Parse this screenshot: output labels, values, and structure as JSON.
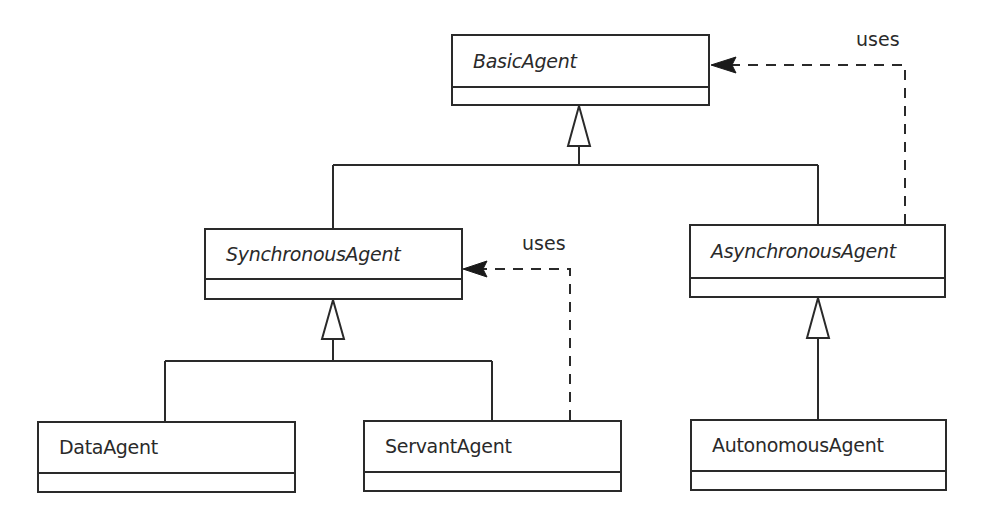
{
  "diagram": {
    "type": "uml-class-diagram",
    "colors": {
      "background": "#ffffff",
      "line": "#2a2a2a"
    },
    "classes": [
      {
        "id": "basic",
        "name": "BasicAgent",
        "abstract": true,
        "x": 451,
        "y": 34,
        "w": 259,
        "h": 72,
        "divider": 52
      },
      {
        "id": "sync",
        "name": "SynchronousAgent",
        "abstract": true,
        "x": 204,
        "y": 228,
        "w": 259,
        "h": 72,
        "divider": 50
      },
      {
        "id": "async",
        "name": "AsynchronousAgent",
        "abstract": true,
        "x": 689,
        "y": 224,
        "w": 257,
        "h": 74,
        "divider": 53
      },
      {
        "id": "data",
        "name": "DataAgent",
        "abstract": false,
        "x": 37,
        "y": 421,
        "w": 259,
        "h": 72,
        "divider": 51
      },
      {
        "id": "servant",
        "name": "ServantAgent",
        "abstract": false,
        "x": 363,
        "y": 420,
        "w": 259,
        "h": 72,
        "divider": 51
      },
      {
        "id": "autonomous",
        "name": "AutonomousAgent",
        "abstract": false,
        "x": 690,
        "y": 419,
        "w": 257,
        "h": 72,
        "divider": 51
      }
    ],
    "generalizations": [
      {
        "parent": "BasicAgent",
        "children": [
          "SynchronousAgent",
          "AsynchronousAgent"
        ],
        "apex": [
          579,
          106
        ],
        "base_y": 146,
        "half_width": 11,
        "stem_end_y": 165,
        "bar": {
          "y": 165,
          "x1": 333,
          "x2": 818
        },
        "drops": [
          {
            "x": 333,
            "y2": 228
          },
          {
            "x": 818,
            "y2": 224
          }
        ]
      },
      {
        "parent": "SynchronousAgent",
        "children": [
          "DataAgent",
          "ServantAgent"
        ],
        "apex": [
          333,
          300
        ],
        "base_y": 339,
        "half_width": 11,
        "stem_end_y": 361,
        "bar": {
          "y": 361,
          "x1": 165,
          "x2": 492
        },
        "drops": [
          {
            "x": 165,
            "y2": 421
          },
          {
            "x": 492,
            "y2": 420
          }
        ]
      },
      {
        "parent": "AsynchronousAgent",
        "children": [
          "AutonomousAgent"
        ],
        "apex": [
          818,
          298
        ],
        "base_y": 338,
        "half_width": 11,
        "stem_end_y": 419,
        "bar": null,
        "drops": []
      }
    ],
    "dependencies": [
      {
        "from": "AsynchronousAgent",
        "to": "BasicAgent",
        "label": "uses",
        "label_pos": [
          856,
          28
        ],
        "path": [
          [
            905,
            224
          ],
          [
            905,
            65
          ],
          [
            712,
            65
          ]
        ],
        "head_tip": [
          711,
          65
        ],
        "head_len": 25,
        "head_half": 8
      },
      {
        "from": "ServantAgent",
        "to": "SynchronousAgent",
        "label": "uses",
        "label_pos": [
          522,
          232
        ],
        "path": [
          [
            570,
            420
          ],
          [
            570,
            269
          ],
          [
            464,
            269
          ]
        ],
        "head_tip": [
          463,
          269
        ],
        "head_len": 24,
        "head_half": 8
      }
    ]
  }
}
